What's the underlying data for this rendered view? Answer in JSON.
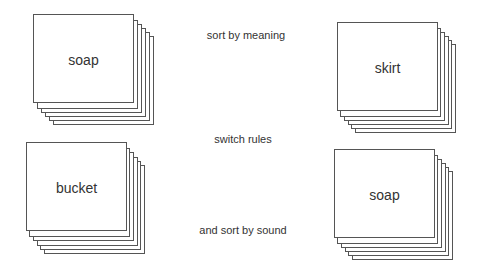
{
  "diagram": {
    "decks": [
      {
        "id": "top-left",
        "label": "soap"
      },
      {
        "id": "top-right",
        "label": "skirt"
      },
      {
        "id": "bottom-left",
        "label": "bucket"
      },
      {
        "id": "bottom-right",
        "label": "soap"
      }
    ],
    "captions": [
      {
        "id": "sort-by-meaning",
        "text": "sort by meaning"
      },
      {
        "id": "switch-rules",
        "text": "switch rules"
      },
      {
        "id": "sort-by-sound",
        "text": "and sort by sound"
      }
    ]
  }
}
